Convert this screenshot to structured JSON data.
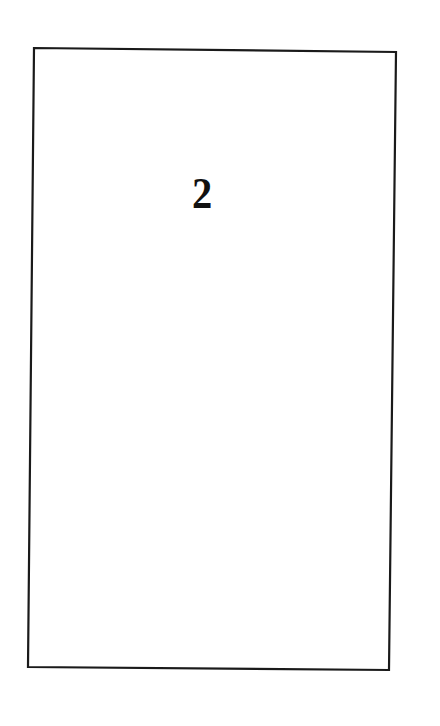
{
  "page": {
    "number": "2",
    "background": "#ffffff",
    "frame_color": "#1a1a1a"
  }
}
